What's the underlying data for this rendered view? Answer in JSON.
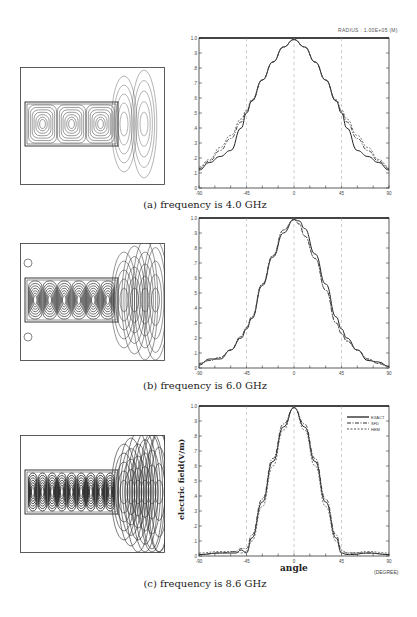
{
  "figure": {
    "panels": [
      {
        "id": "a",
        "caption": "(a) frequency is 4.0 GHz",
        "radius_note": "RADIUS : 1.00E+05 (M)",
        "field_plot": {
          "label": "near-field contour plot",
          "lobes_in_guide": 3
        }
      },
      {
        "id": "b",
        "caption": "(b) frequency is 6.0 GHz",
        "field_plot": {
          "label": "near-field contour plot",
          "lobes_in_guide": 6
        }
      },
      {
        "id": "c",
        "caption": "(c) frequency is 8.6 GHz",
        "xlabel": "angle",
        "ylabel": "electric field(V/m)",
        "x_unit": "(DEGREE)",
        "legend": [
          "EXACT",
          "SFD",
          "HEM"
        ],
        "field_plot": {
          "label": "near-field contour plot",
          "lobes_in_guide": 9
        }
      }
    ]
  },
  "chart_data": [
    {
      "type": "line",
      "title": "(a) frequency is 4.0 GHz",
      "xlabel": "",
      "ylabel": "",
      "xlim": [
        -90,
        90
      ],
      "ylim": [
        0,
        1.0
      ],
      "x_ticks": [
        "-90",
        "-45",
        "0",
        "45",
        "90"
      ],
      "y_ticks": [
        "0",
        ".1",
        ".2",
        ".3",
        ".4",
        ".5",
        ".6",
        ".7",
        ".8",
        ".9",
        "1.0"
      ],
      "annotation": "RADIUS : 1.00E+05 (M)",
      "grid": "dashed vertical at -45, 0, 45",
      "x": [
        -90,
        -80,
        -70,
        -60,
        -50,
        -45,
        -40,
        -30,
        -20,
        -10,
        0,
        10,
        20,
        30,
        40,
        45,
        50,
        60,
        70,
        80,
        90
      ],
      "series": [
        {
          "name": "EXACT",
          "values": [
            0.12,
            0.17,
            0.21,
            0.25,
            0.4,
            0.5,
            0.58,
            0.72,
            0.84,
            0.94,
            0.99,
            0.94,
            0.84,
            0.72,
            0.58,
            0.5,
            0.4,
            0.25,
            0.21,
            0.17,
            0.12
          ]
        },
        {
          "name": "SFD",
          "values": [
            0.13,
            0.18,
            0.25,
            0.33,
            0.44,
            0.51,
            0.58,
            0.72,
            0.84,
            0.94,
            0.99,
            0.94,
            0.84,
            0.72,
            0.58,
            0.51,
            0.44,
            0.33,
            0.25,
            0.18,
            0.13
          ]
        },
        {
          "name": "HEM",
          "values": [
            0.14,
            0.19,
            0.27,
            0.35,
            0.46,
            0.52,
            0.59,
            0.72,
            0.84,
            0.94,
            0.99,
            0.94,
            0.84,
            0.72,
            0.59,
            0.52,
            0.46,
            0.35,
            0.27,
            0.19,
            0.14
          ]
        }
      ]
    },
    {
      "type": "line",
      "title": "(b) frequency is 6.0 GHz",
      "xlabel": "",
      "ylabel": "",
      "xlim": [
        -90,
        90
      ],
      "ylim": [
        0,
        1.0
      ],
      "x_ticks": [
        "-90",
        "-45",
        "0",
        "45",
        "90"
      ],
      "y_ticks": [
        "0",
        ".1",
        ".2",
        ".3",
        ".4",
        ".5",
        ".6",
        ".7",
        ".8",
        ".9",
        "1.0"
      ],
      "grid": "dashed vertical at -45, 0, 45",
      "x": [
        -90,
        -80,
        -70,
        -60,
        -50,
        -45,
        -40,
        -30,
        -20,
        -10,
        0,
        5,
        10,
        20,
        30,
        40,
        45,
        50,
        60,
        70,
        80,
        90
      ],
      "series": [
        {
          "name": "EXACT",
          "values": [
            0.02,
            0.06,
            0.06,
            0.12,
            0.2,
            0.26,
            0.33,
            0.55,
            0.74,
            0.9,
            0.99,
            0.98,
            0.93,
            0.76,
            0.56,
            0.34,
            0.26,
            0.2,
            0.12,
            0.05,
            0.04,
            0.01
          ]
        },
        {
          "name": "SFD",
          "values": [
            0.03,
            0.05,
            0.07,
            0.12,
            0.21,
            0.27,
            0.34,
            0.56,
            0.75,
            0.92,
            0.99,
            0.96,
            0.88,
            0.73,
            0.52,
            0.3,
            0.23,
            0.18,
            0.12,
            0.06,
            0.03,
            0.01
          ]
        },
        {
          "name": "HEM",
          "values": [
            0.03,
            0.05,
            0.07,
            0.12,
            0.21,
            0.27,
            0.34,
            0.56,
            0.75,
            0.92,
            0.99,
            0.96,
            0.88,
            0.73,
            0.52,
            0.3,
            0.23,
            0.18,
            0.12,
            0.06,
            0.03,
            0.01
          ]
        }
      ]
    },
    {
      "type": "line",
      "title": "(c) frequency is 8.6 GHz",
      "xlabel": "angle",
      "ylabel": "electric field(V/m)",
      "x_unit": "(DEGREE)",
      "xlim": [
        -90,
        90
      ],
      "ylim": [
        0,
        1.0
      ],
      "x_ticks": [
        "-90",
        "-45",
        "0",
        "45",
        "90"
      ],
      "y_ticks": [
        "0",
        ".1",
        ".2",
        ".3",
        ".4",
        ".5",
        ".6",
        ".7",
        ".8",
        ".9",
        "1.0"
      ],
      "legend": [
        "EXACT",
        "SFD",
        "HEM"
      ],
      "legend_position": "upper right",
      "grid": "dashed vertical at -45, 0, 45",
      "x": [
        -90,
        -70,
        -55,
        -50,
        -45,
        -40,
        -30,
        -20,
        -10,
        0,
        10,
        20,
        30,
        40,
        45,
        50,
        55,
        70,
        90
      ],
      "series": [
        {
          "name": "EXACT",
          "values": [
            0.01,
            0.02,
            0.02,
            0.04,
            0.02,
            0.12,
            0.36,
            0.63,
            0.86,
            0.99,
            0.86,
            0.63,
            0.36,
            0.12,
            0.02,
            0.01,
            0.01,
            0.02,
            0.01
          ]
        },
        {
          "name": "SFD",
          "values": [
            0.01,
            0.02,
            0.03,
            0.05,
            0.05,
            0.14,
            0.38,
            0.65,
            0.88,
            0.99,
            0.88,
            0.65,
            0.38,
            0.14,
            0.04,
            0.02,
            0.02,
            0.02,
            0.01
          ]
        },
        {
          "name": "HEM",
          "values": [
            0.02,
            0.03,
            0.03,
            0.02,
            0.03,
            0.1,
            0.33,
            0.6,
            0.84,
            0.99,
            0.84,
            0.6,
            0.33,
            0.1,
            0.02,
            0.02,
            0.02,
            0.03,
            0.02
          ]
        }
      ]
    }
  ]
}
